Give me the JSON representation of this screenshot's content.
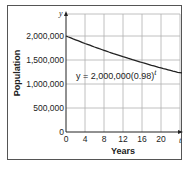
{
  "chart_data": {
    "type": "line",
    "title": "",
    "xlabel": "Years",
    "ylabel": "Population",
    "x_axis_var": "t",
    "y_axis_var": "y",
    "equation": {
      "lhs": "y = 2,000,000(0.98)",
      "exponent": "t"
    },
    "xlim": [
      0,
      24
    ],
    "ylim": [
      0,
      2500000
    ],
    "x_ticks": [
      "0",
      "4",
      "8",
      "12",
      "16",
      "20"
    ],
    "y_ticks": [
      "0",
      "500,000",
      "1,000,000",
      "1,500,000",
      "2,000,000"
    ],
    "grid": true,
    "series": [
      {
        "name": "y = 2,000,000(0.98)^t",
        "x": [
          0,
          4,
          8,
          12,
          16,
          20,
          24
        ],
        "values": [
          2000000,
          1844832,
          1701699,
          1569721,
          1448082,
          1335294,
          1231682
        ]
      }
    ],
    "colors": {
      "line": "#222222",
      "grid": "#b0b0b0",
      "axis": "#222222",
      "frame": "#555555"
    }
  }
}
